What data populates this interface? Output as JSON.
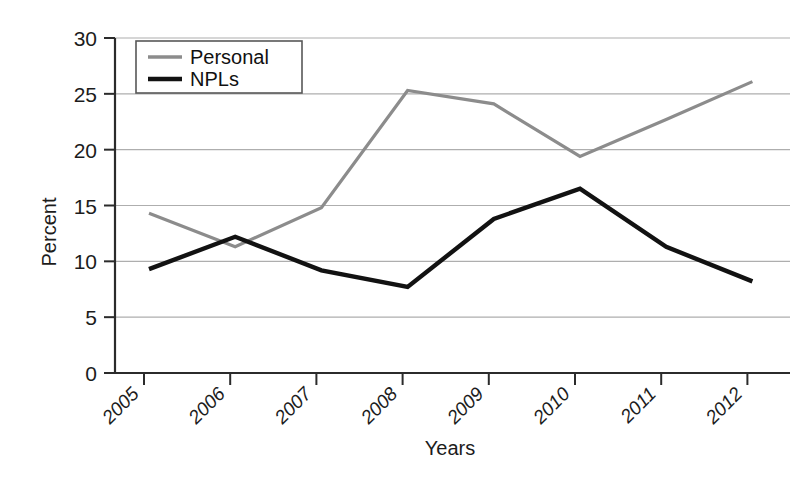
{
  "chart_data": {
    "type": "line",
    "title": "",
    "xlabel": "Years",
    "ylabel": "Percent",
    "categories": [
      "2005",
      "2006",
      "2007",
      "2008",
      "2009",
      "2010",
      "2011",
      "2012"
    ],
    "x": [
      2005,
      2006,
      2007,
      2008,
      2009,
      2010,
      2011,
      2012
    ],
    "ylim": [
      0,
      30
    ],
    "yticks": [
      0,
      5,
      10,
      15,
      20,
      25,
      30
    ],
    "ytick_labels": [
      "0",
      "5",
      "10",
      "15",
      "20",
      "25",
      "30"
    ],
    "grid": "horizontal",
    "legend_position": "top-left",
    "series": [
      {
        "name": "Personal",
        "color": "#8c8c8c",
        "width": 3.2,
        "values": [
          14.3,
          11.3,
          14.8,
          25.3,
          24.1,
          19.4,
          22.7,
          26.1
        ]
      },
      {
        "name": "NPLs",
        "color": "#121212",
        "width": 4.4,
        "values": [
          9.3,
          12.2,
          9.2,
          7.7,
          13.8,
          16.5,
          11.3,
          8.2
        ]
      }
    ]
  },
  "axes": {
    "y_axis_label": "Percent",
    "x_axis_label": "Years"
  },
  "legend": {
    "items": [
      {
        "label": "Personal",
        "swatch": "gray-line-swatch"
      },
      {
        "label": "NPLs",
        "swatch": "black-line-swatch"
      }
    ]
  },
  "colors": {
    "personal": "#8c8c8c",
    "npls": "#121212",
    "grid": "#aeaeae",
    "axis": "#2b2b2b",
    "background": "#ffffff"
  }
}
